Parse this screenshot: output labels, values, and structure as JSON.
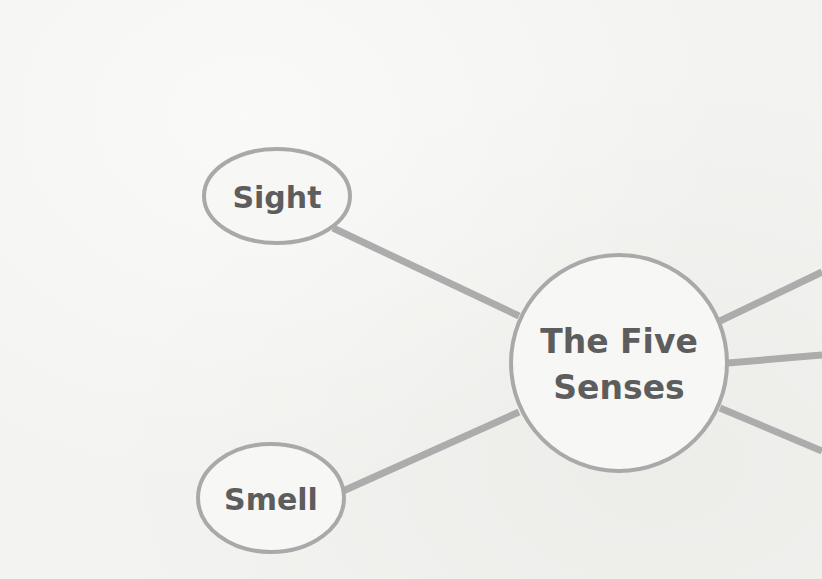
{
  "diagram": {
    "type": "mind-map",
    "colors": {
      "background": "#f3f3f1",
      "outline": "#a9a9a9",
      "connector": "#acacac",
      "text": "#5d5d5d"
    },
    "center": {
      "label_line1": "The Five",
      "label_line2": "Senses"
    },
    "nodes": [
      {
        "id": "sight",
        "label": "Sight"
      },
      {
        "id": "smell",
        "label": "Smell"
      }
    ],
    "offscreen_branches": 3
  }
}
